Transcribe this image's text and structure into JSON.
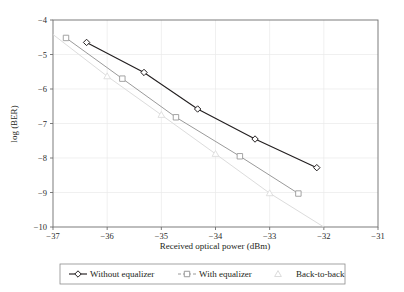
{
  "chart_data": {
    "type": "line",
    "title": "",
    "xlabel": "Received optical power (dBm)",
    "ylabel": "log (BER)",
    "xlim": [
      -37,
      -31
    ],
    "ylim": [
      -10,
      -4
    ],
    "xticks": [
      -37,
      -36,
      -35,
      -34,
      -33,
      -32,
      -31
    ],
    "xtick_labels": [
      "−37",
      "−36",
      "−35",
      "−34",
      "−33",
      "−32",
      "−31"
    ],
    "yticks": [
      -10,
      -9,
      -8,
      -7,
      -6,
      -5,
      -4
    ],
    "ytick_labels": [
      "−10",
      "−9",
      "−8",
      "−7",
      "−6",
      "−5",
      "−4"
    ],
    "grid": true,
    "legend_position": "bottom-outside",
    "series": [
      {
        "name": "Without equalizer",
        "marker": "diamond",
        "color": "#231f20",
        "x": [
          -36.38,
          -35.32,
          -34.33,
          -33.27,
          -32.13
        ],
        "y": [
          -4.65,
          -5.52,
          -6.58,
          -7.45,
          -8.28
        ]
      },
      {
        "name": "With equalizer",
        "marker": "square",
        "color": "#9a9a9a",
        "x": [
          -36.76,
          -35.72,
          -34.73,
          -33.55,
          -32.47
        ],
        "y": [
          -4.52,
          -5.7,
          -6.82,
          -7.95,
          -9.03
        ]
      },
      {
        "name": "Back-to-back",
        "marker": "triangle",
        "color": "#dcdcdc",
        "x": [
          -37.0,
          -36.0,
          -35.0,
          -34.0,
          -33.0,
          -32.0
        ],
        "y": [
          -4.42,
          -5.63,
          -6.75,
          -7.88,
          -9.02,
          -10.0
        ]
      }
    ]
  },
  "legend": {
    "items": [
      {
        "label": "Without equalizer",
        "marker": "diamond",
        "color": "#231f20"
      },
      {
        "label": "With equalizer",
        "marker": "square",
        "color": "#9a9a9a"
      },
      {
        "label": "Back-to-back",
        "marker": "triangle",
        "color": "#dcdcdc"
      }
    ]
  },
  "axes": {
    "x_title": "Received optical power (dBm)",
    "y_title": "log (BER)"
  }
}
